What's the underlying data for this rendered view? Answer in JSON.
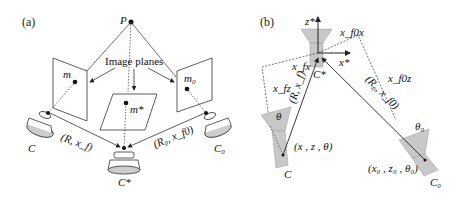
{
  "figure": {
    "panel_a": {
      "label": "(a)",
      "point_label": "P",
      "image_planes_label": "Image planes",
      "plane_labels": [
        "m",
        "m*",
        "m₀"
      ],
      "camera_labels": [
        "C",
        "C*",
        "C₀"
      ],
      "transform_labels": [
        "(R, x_f)",
        "(R₀, x_f0)"
      ]
    },
    "panel_b": {
      "label": "(b)",
      "axis_labels": {
        "z": "z*",
        "x": "x*"
      },
      "reference_camera": "C*",
      "component_labels": [
        "x_fx",
        "x_fz",
        "x_f0x",
        "x_f0z"
      ],
      "transform_labels": [
        "(R, x_f)",
        "(R₀, x_f0)"
      ],
      "angle_labels": [
        "θ",
        "θ₀"
      ],
      "camera_labels": [
        "C",
        "C₀"
      ],
      "pose_labels": [
        "(x , z , θ)",
        "(x₀ , z₀ , θ₀)"
      ]
    },
    "colors": {
      "line": "#222222",
      "camera_fill": "#c8c8c8",
      "camera_body": "#e0e0e0"
    }
  }
}
